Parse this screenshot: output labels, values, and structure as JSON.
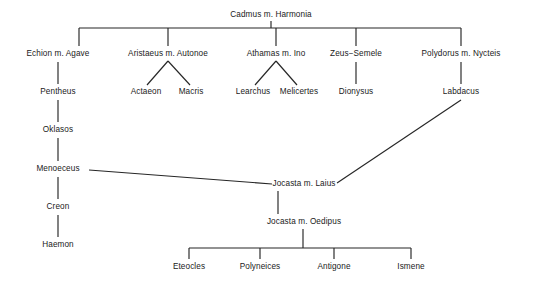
{
  "diagram": {
    "type": "genealogy-tree",
    "canvas": {
      "width": 533,
      "height": 287
    },
    "colors": {
      "background": "#ffffff",
      "line": "#262626",
      "text": "#1a1a1a"
    },
    "nodes": [
      {
        "id": "cadmus",
        "label": "Cadmus m. Harmonia",
        "x": 271,
        "y": 15,
        "generation": 1
      },
      {
        "id": "echion",
        "label": "Echion m. Agave",
        "x": 58,
        "y": 54,
        "generation": 2
      },
      {
        "id": "aristaeus",
        "label": "Aristaeus m. Autonoe",
        "x": 168,
        "y": 54,
        "generation": 2
      },
      {
        "id": "athamas",
        "label": "Athamas m. Ino",
        "x": 276,
        "y": 54,
        "generation": 2
      },
      {
        "id": "zeus",
        "label": "Zeus−Semele",
        "x": 356,
        "y": 54,
        "generation": 2
      },
      {
        "id": "polydorus",
        "label": "Polydorus m. Nycteis",
        "x": 461,
        "y": 54,
        "generation": 2
      },
      {
        "id": "pentheus",
        "label": "Pentheus",
        "x": 58,
        "y": 92,
        "generation": 3
      },
      {
        "id": "actaeon",
        "label": "Actaeon",
        "x": 146,
        "y": 92,
        "generation": 3
      },
      {
        "id": "macris",
        "label": "Macris",
        "x": 191,
        "y": 92,
        "generation": 3
      },
      {
        "id": "learchus",
        "label": "Learchus",
        "x": 253,
        "y": 92,
        "generation": 3
      },
      {
        "id": "melicertes",
        "label": "Melicertes",
        "x": 299,
        "y": 92,
        "generation": 3
      },
      {
        "id": "dionysus",
        "label": "Dionysus",
        "x": 356,
        "y": 92,
        "generation": 3
      },
      {
        "id": "labdacus",
        "label": "Labdacus",
        "x": 461,
        "y": 92,
        "generation": 3
      },
      {
        "id": "oklasos",
        "label": "Oklasos",
        "x": 58,
        "y": 130,
        "generation": 4
      },
      {
        "id": "menoeceus",
        "label": "Menoeceus",
        "x": 58,
        "y": 169,
        "generation": 5
      },
      {
        "id": "creon",
        "label": "Creon",
        "x": 58,
        "y": 207,
        "generation": 6
      },
      {
        "id": "haemon",
        "label": "Haemon",
        "x": 58,
        "y": 245,
        "generation": 7
      },
      {
        "id": "jocasta-laius",
        "label": "Jocasta  m.  Laius",
        "x": 304,
        "y": 184,
        "generation": 6
      },
      {
        "id": "jocasta-oedipus",
        "label": "Jocasta  m.  Oedipus",
        "x": 304,
        "y": 222,
        "generation": 7
      },
      {
        "id": "eteocles",
        "label": "Eteocles",
        "x": 189,
        "y": 267,
        "generation": 8
      },
      {
        "id": "polyneices",
        "label": "Polyneices",
        "x": 260,
        "y": 267,
        "generation": 8
      },
      {
        "id": "antigone",
        "label": "Antigone",
        "x": 334,
        "y": 267,
        "generation": 8
      },
      {
        "id": "ismene",
        "label": "Ismene",
        "x": 411,
        "y": 267,
        "generation": 8
      }
    ],
    "edges": [
      {
        "id": "cadmus-stem",
        "kind": "line",
        "from": "cadmus",
        "to": "sibling-bar-1",
        "points": "271,21 271,28"
      },
      {
        "id": "cadmus-sibling-bar",
        "kind": "line",
        "from": "cadmus",
        "to": "children-gen2",
        "points": "79,28 461,28"
      },
      {
        "id": "drop-echion",
        "kind": "line",
        "from": "bar",
        "to": "echion",
        "points": "79,28 79,46"
      },
      {
        "id": "drop-aristaeus",
        "kind": "line",
        "from": "bar",
        "to": "aristaeus",
        "points": "168,28 168,46"
      },
      {
        "id": "drop-athamas",
        "kind": "line",
        "from": "bar",
        "to": "athamas",
        "points": "276,28 276,46"
      },
      {
        "id": "drop-zeus",
        "kind": "line",
        "from": "bar",
        "to": "zeus",
        "points": "356,28 356,46"
      },
      {
        "id": "drop-polydorus",
        "kind": "line",
        "from": "bar",
        "to": "polydorus",
        "points": "461,28 461,46"
      },
      {
        "id": "echion-pentheus",
        "kind": "line",
        "from": "echion",
        "to": "pentheus",
        "points": "58,62 58,84"
      },
      {
        "id": "aristaeus-actaeon",
        "kind": "line",
        "from": "aristaeus",
        "to": "actaeon",
        "points": "168,61 147,85"
      },
      {
        "id": "aristaeus-macris",
        "kind": "line",
        "from": "aristaeus",
        "to": "macris",
        "points": "168,61 190,85"
      },
      {
        "id": "athamas-learchus",
        "kind": "line",
        "from": "athamas",
        "to": "learchus",
        "points": "276,61 255,85"
      },
      {
        "id": "athamas-melicertes",
        "kind": "line",
        "from": "athamas",
        "to": "melicertes",
        "points": "276,61 297,85"
      },
      {
        "id": "zeus-dionysus",
        "kind": "line",
        "from": "zeus",
        "to": "dionysus",
        "points": "356,62 356,84"
      },
      {
        "id": "polydorus-labdacus",
        "kind": "line",
        "from": "polydorus",
        "to": "labdacus",
        "points": "461,62 461,84"
      },
      {
        "id": "pentheus-oklasos",
        "kind": "line",
        "from": "pentheus",
        "to": "oklasos",
        "points": "58,100 58,122"
      },
      {
        "id": "oklasos-menoeceus",
        "kind": "line",
        "from": "oklasos",
        "to": "menoeceus",
        "points": "58,138 58,161"
      },
      {
        "id": "menoeceus-creon",
        "kind": "line",
        "from": "menoeceus",
        "to": "creon",
        "points": "58,177 58,199"
      },
      {
        "id": "creon-haemon",
        "kind": "line",
        "from": "creon",
        "to": "haemon",
        "points": "58,215 58,237"
      },
      {
        "id": "menoeceus-jocasta",
        "kind": "line",
        "from": "menoeceus",
        "to": "jocasta-laius",
        "points": "89,170 272,184"
      },
      {
        "id": "labdacus-laius",
        "kind": "line",
        "from": "labdacus",
        "to": "jocasta-laius",
        "points": "461,100 337,183"
      },
      {
        "id": "laius-oedipus",
        "kind": "line",
        "from": "jocasta-laius",
        "to": "jocasta-oedipus",
        "points": "278,191 278,214"
      },
      {
        "id": "oedipus-stem",
        "kind": "line",
        "from": "jocasta-oedipus",
        "to": "children-bar",
        "points": "303,229 303,248"
      },
      {
        "id": "children-bar",
        "kind": "line",
        "from": "jocasta-oedipus",
        "to": "children",
        "points": "189,248 411,248"
      },
      {
        "id": "drop-eteocles",
        "kind": "line",
        "from": "children-bar",
        "to": "eteocles",
        "points": "189,248 189,259"
      },
      {
        "id": "drop-polyneices",
        "kind": "line",
        "from": "children-bar",
        "to": "polyneices",
        "points": "260,248 260,259"
      },
      {
        "id": "drop-antigone",
        "kind": "line",
        "from": "children-bar",
        "to": "antigone",
        "points": "334,248 334,259"
      },
      {
        "id": "drop-ismene",
        "kind": "line",
        "from": "children-bar",
        "to": "ismene",
        "points": "411,248 411,259"
      }
    ]
  }
}
